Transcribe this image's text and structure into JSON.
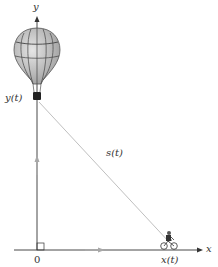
{
  "figure": {
    "axes": {
      "x_label": "x",
      "y_label": "y",
      "origin_label": "0"
    },
    "labels": {
      "balloon_height": "y(t)",
      "distance": "s(t)",
      "bike_position": "x(t)"
    },
    "objects": {
      "balloon": "hot-air-balloon",
      "bicycle": "bicycle-rider"
    },
    "colors": {
      "axis": "#333333",
      "line": "#b8b8b8",
      "arrow": "#a0a0a0",
      "balloon_fill": "#c8c8c8",
      "balloon_stripe": "#444444"
    }
  }
}
